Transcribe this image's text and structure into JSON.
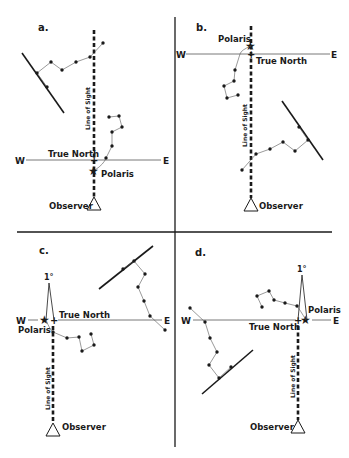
{
  "figure": {
    "panels": [
      {
        "id": "a",
        "label": "a.",
        "compass": {
          "west": "W",
          "east": "E"
        },
        "true_north_label": "True North",
        "polaris_label": "Polaris",
        "line_of_sight_label": "Line of Sight",
        "observer_label": "Observer"
      },
      {
        "id": "b",
        "label": "b.",
        "compass": {
          "west": "W",
          "east": "E"
        },
        "true_north_label": "True North",
        "polaris_label": "Polaris",
        "line_of_sight_label": "Line of Sight",
        "observer_label": "Observer"
      },
      {
        "id": "c",
        "label": "c.",
        "compass": {
          "west": "W",
          "east": "E"
        },
        "true_north_label": "True North",
        "polaris_label": "Polaris",
        "line_of_sight_label": "Line of Sight",
        "observer_label": "Observer",
        "angle_label": "1°"
      },
      {
        "id": "d",
        "label": "d.",
        "compass": {
          "west": "W",
          "east": "E"
        },
        "true_north_label": "True North",
        "polaris_label": "Polaris",
        "line_of_sight_label": "Line of Sight",
        "observer_label": "Observer",
        "angle_label": "1°"
      }
    ]
  },
  "colors": {
    "ink": "#1a1a1a",
    "thin": "#555555",
    "background": "#ffffff"
  }
}
